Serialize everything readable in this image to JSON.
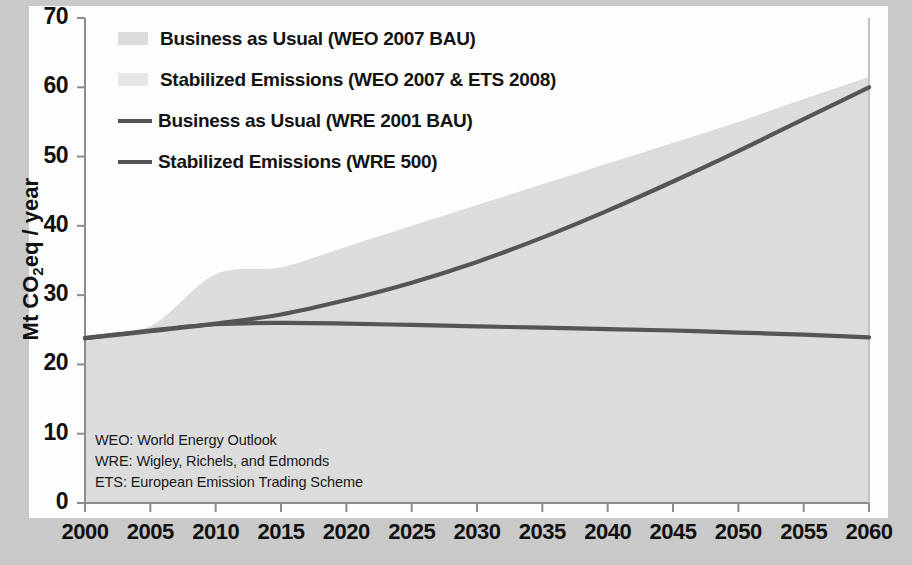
{
  "figure": {
    "background_color": "#c9c9c9",
    "canvas_color": "#fdfdfd",
    "band_color": "#dcdcdc",
    "band_color_light": "#e4e4e4",
    "line_color": "#555555"
  },
  "legend": {
    "items": [
      {
        "label": "Business as Usual (WEO 2007 BAU)",
        "type": "area",
        "color": "#dcdcdc",
        "swatch": "area-swatch"
      },
      {
        "label": "Stabilized Emissions (WEO 2007 & ETS 2008)",
        "type": "area",
        "color": "#e6e6e6",
        "swatch": "area-swatch"
      },
      {
        "label": "Business as Usual (WRE 2001 BAU)",
        "type": "line",
        "color": "#555555",
        "swatch": "line-swatch"
      },
      {
        "label": "Stabilized Emissions (WRE 500)",
        "type": "line",
        "color": "#555555",
        "swatch": "line-swatch"
      }
    ]
  },
  "notes": [
    "WEO: World Energy Outlook",
    "WRE: Wigley, Richels, and Edmonds",
    "ETS: European Emission Trading Scheme"
  ],
  "chart_data": {
    "type": "area",
    "title": "",
    "xlabel": "",
    "ylabel": "Mt CO₂eq / year",
    "ylabel_plain": "Mt CO2eq / year",
    "xlim": [
      2000,
      2060
    ],
    "ylim": [
      0,
      70
    ],
    "xticks": [
      2000,
      2005,
      2010,
      2015,
      2020,
      2025,
      2030,
      2035,
      2040,
      2045,
      2050,
      2055,
      2060
    ],
    "yticks": [
      0,
      10,
      20,
      30,
      40,
      50,
      60,
      70
    ],
    "grid": false,
    "legend_position": "upper-left",
    "x": [
      2000,
      2005,
      2010,
      2015,
      2020,
      2025,
      2030,
      2035,
      2040,
      2045,
      2050,
      2055,
      2060
    ],
    "series": [
      {
        "name": "Business as Usual (WEO 2007 BAU)",
        "kind": "band-upper",
        "values": [
          24.0,
          25.5,
          33.0,
          34.0,
          37.0,
          40.0,
          43.0,
          46.0,
          49.0,
          52.0,
          55.0,
          58.3,
          61.5
        ]
      },
      {
        "name": "Stabilized Emissions (WEO 2007 & ETS 2008)",
        "kind": "band-lower",
        "values": [
          0,
          0,
          0,
          0,
          0,
          0,
          0,
          0,
          0,
          0,
          0,
          0,
          0
        ]
      },
      {
        "name": "Business as Usual (WRE 2001 BAU)",
        "kind": "line",
        "values": [
          23.8,
          24.8,
          25.9,
          27.2,
          29.3,
          31.8,
          34.8,
          38.3,
          42.2,
          46.4,
          50.8,
          55.4,
          60.0
        ]
      },
      {
        "name": "Stabilized Emissions (WRE 500)",
        "kind": "line",
        "values": [
          23.8,
          24.9,
          25.8,
          26.0,
          25.9,
          25.7,
          25.5,
          25.3,
          25.1,
          24.9,
          24.6,
          24.3,
          23.9
        ]
      }
    ]
  }
}
